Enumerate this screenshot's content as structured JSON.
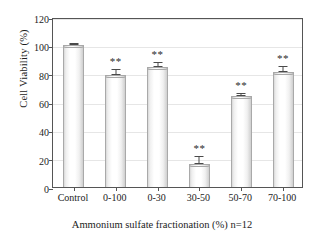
{
  "chart_data": {
    "type": "bar",
    "title": "",
    "xlabel": "Ammonium sulfate fractionation (%)  n=12",
    "ylabel": "Cell Viability (%)",
    "categories": [
      "Control",
      "0-100",
      "0-30",
      "30-50",
      "50-70",
      "70-100"
    ],
    "values": [
      100,
      79,
      85,
      16,
      64,
      81
    ],
    "errors": [
      0.8,
      3.5,
      2.5,
      5.5,
      2.0,
      4.0
    ],
    "annotations": [
      "",
      "**",
      "**",
      "**",
      "**",
      "**"
    ],
    "ylim": [
      0,
      120
    ],
    "yticks": [
      0,
      20,
      40,
      60,
      80,
      100,
      120
    ],
    "ytick_labels": [
      "0",
      "20",
      "40",
      "60",
      "80",
      "100",
      "120"
    ],
    "grid": true,
    "legend": false,
    "series": [
      {
        "name": "Cell Viability",
        "values": [
          100,
          79,
          85,
          16,
          64,
          81
        ]
      }
    ],
    "colors": {
      "bar_fill": "#ffffff",
      "bar_edge": "#a9a9a9",
      "error_bar": "#4a4a4a",
      "gridline": "#e6e6e6",
      "axis": "#555555",
      "text": "#1c1c1c"
    }
  }
}
